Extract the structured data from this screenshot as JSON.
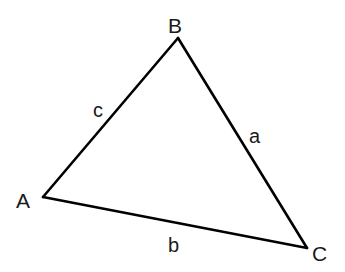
{
  "diagram": {
    "type": "triangle",
    "vertices": [
      {
        "id": "A",
        "label": "A",
        "x": 43,
        "y": 197,
        "label_x": 16,
        "label_y": 208
      },
      {
        "id": "B",
        "label": "B",
        "x": 178,
        "y": 38,
        "label_x": 168,
        "label_y": 33
      },
      {
        "id": "C",
        "label": "C",
        "x": 307,
        "y": 248,
        "label_x": 312,
        "label_y": 261
      }
    ],
    "sides": [
      {
        "id": "c",
        "label": "c",
        "from": "A",
        "to": "B",
        "label_x": 93,
        "label_y": 117
      },
      {
        "id": "a",
        "label": "a",
        "from": "B",
        "to": "C",
        "label_x": 249,
        "label_y": 143
      },
      {
        "id": "b",
        "label": "b",
        "from": "A",
        "to": "C",
        "label_x": 168,
        "label_y": 252
      }
    ],
    "colors": {
      "line": "#000000",
      "text": "#1a1a1a",
      "background": "#ffffff"
    }
  }
}
